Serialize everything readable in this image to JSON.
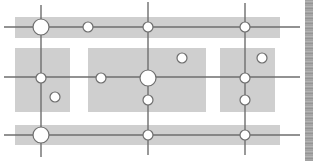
{
  "diagram": {
    "title": "",
    "colors": {
      "background": "#ffffff",
      "block": "#cfcfcf",
      "line": "#6e6e6e",
      "node_fill": "#ffffff",
      "node_stroke": "#6e6e6e",
      "edge_strip": "#a0a0a0"
    },
    "blocks": [
      {
        "id": "top-band",
        "x": 15,
        "y": 17,
        "w": 265,
        "h": 21
      },
      {
        "id": "left-block",
        "x": 15,
        "y": 48,
        "w": 55,
        "h": 64
      },
      {
        "id": "center-block",
        "x": 88,
        "y": 48,
        "w": 118,
        "h": 64
      },
      {
        "id": "right-block",
        "x": 220,
        "y": 48,
        "w": 55,
        "h": 64
      },
      {
        "id": "bottom-band",
        "x": 15,
        "y": 125,
        "w": 265,
        "h": 20
      }
    ],
    "lines": [
      {
        "id": "h-top",
        "x1": 4,
        "y1": 27,
        "x2": 300,
        "y2": 27
      },
      {
        "id": "h-middle",
        "x1": 4,
        "y1": 77,
        "x2": 300,
        "y2": 77
      },
      {
        "id": "h-bottom",
        "x1": 4,
        "y1": 135,
        "x2": 300,
        "y2": 135
      },
      {
        "id": "v-left",
        "x1": 41,
        "y1": 5,
        "x2": 41,
        "y2": 157
      },
      {
        "id": "v-center",
        "x1": 148,
        "y1": 2,
        "x2": 148,
        "y2": 155
      },
      {
        "id": "v-right",
        "x1": 245,
        "y1": 3,
        "x2": 245,
        "y2": 155
      }
    ],
    "nodes": [
      {
        "id": "n1",
        "cx": 41,
        "cy": 27,
        "r": 8,
        "size": "large"
      },
      {
        "id": "n2",
        "cx": 88,
        "cy": 27,
        "r": 5,
        "size": "small"
      },
      {
        "id": "n3",
        "cx": 148,
        "cy": 27,
        "r": 5,
        "size": "small"
      },
      {
        "id": "n4",
        "cx": 245,
        "cy": 27,
        "r": 5,
        "size": "small"
      },
      {
        "id": "n5",
        "cx": 41,
        "cy": 78,
        "r": 5,
        "size": "small"
      },
      {
        "id": "n6",
        "cx": 55,
        "cy": 97,
        "r": 5,
        "size": "small"
      },
      {
        "id": "n7",
        "cx": 101,
        "cy": 78,
        "r": 5,
        "size": "small"
      },
      {
        "id": "n8",
        "cx": 148,
        "cy": 78,
        "r": 8,
        "size": "large"
      },
      {
        "id": "n9",
        "cx": 182,
        "cy": 58,
        "r": 5,
        "size": "small"
      },
      {
        "id": "n10",
        "cx": 148,
        "cy": 100,
        "r": 5,
        "size": "small"
      },
      {
        "id": "n11",
        "cx": 245,
        "cy": 78,
        "r": 5,
        "size": "small"
      },
      {
        "id": "n12",
        "cx": 262,
        "cy": 58,
        "r": 5,
        "size": "small"
      },
      {
        "id": "n13",
        "cx": 245,
        "cy": 100,
        "r": 5,
        "size": "small"
      },
      {
        "id": "n14",
        "cx": 41,
        "cy": 135,
        "r": 8,
        "size": "large"
      },
      {
        "id": "n15",
        "cx": 148,
        "cy": 135,
        "r": 5,
        "size": "small"
      },
      {
        "id": "n16",
        "cx": 245,
        "cy": 135,
        "r": 5,
        "size": "small"
      }
    ]
  }
}
